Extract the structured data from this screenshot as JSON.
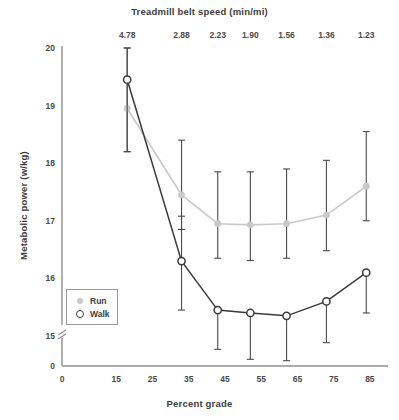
{
  "chart_data": {
    "type": "line",
    "title": "",
    "xlabel": "Percent grade",
    "ylabel": "Metabolic power (w/kg)",
    "top_axis_label": "Treadmill belt speed (min/mi)",
    "xlim": [
      0,
      90
    ],
    "ylim": [
      14.55,
      20.0
    ],
    "grid": false,
    "legend_position": "bottom-left",
    "x_ticks": [
      "0",
      "15",
      "25",
      "35",
      "45",
      "55",
      "65",
      "75",
      "85"
    ],
    "x_tick_values": [
      0,
      15,
      25,
      35,
      45,
      55,
      65,
      75,
      85
    ],
    "y_ticks": [
      "0",
      "15",
      "16",
      "17",
      "18",
      "19",
      "20"
    ],
    "y_tick_values": [
      14.6,
      15,
      16,
      17,
      18,
      19,
      20
    ],
    "y_axis_broken": true,
    "top_ticks": [
      "4.78",
      "2.88",
      "2.23",
      "1.90",
      "1.56",
      "1.36",
      "1.23"
    ],
    "top_tick_x_values": [
      18,
      33,
      43,
      52,
      62,
      73,
      84
    ],
    "x": [
      18,
      33,
      43,
      52,
      62,
      73,
      84
    ],
    "series": [
      {
        "name": "Run",
        "color": "#c9c9c9",
        "marker": "filled-circle",
        "values": [
          18.95,
          17.45,
          16.95,
          16.93,
          16.95,
          17.1,
          17.6
        ],
        "err_low": [
          0.75,
          0.6,
          0.6,
          0.62,
          0.6,
          0.62,
          0.6
        ],
        "err_high": [
          1.05,
          0.95,
          0.9,
          0.92,
          0.95,
          0.95,
          0.95
        ]
      },
      {
        "name": "Walk",
        "color": "#3a3a3a",
        "marker": "open-circle",
        "values": [
          19.45,
          16.3,
          15.45,
          15.4,
          15.35,
          15.6,
          16.1
        ],
        "err_low": [
          1.25,
          0.85,
          0.65,
          0.75,
          0.72,
          0.7,
          0.7
        ],
        "err_high": [
          0.55,
          0.78,
          0.0,
          0.0,
          0.0,
          0.0,
          0.0
        ]
      }
    ],
    "legend": [
      {
        "label": "Run",
        "marker": "filled-circle"
      },
      {
        "label": "Walk",
        "marker": "open-circle"
      }
    ]
  }
}
